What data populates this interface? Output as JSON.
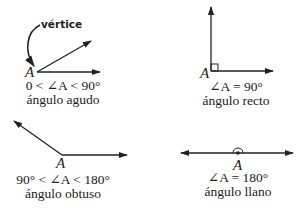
{
  "annotation": {
    "vertex_label": "vértice"
  },
  "angles": [
    {
      "id": "acute",
      "vertex": "A",
      "relation": "0 < ∠A < 90°",
      "name": "ángulo agudo"
    },
    {
      "id": "right",
      "vertex": "A",
      "relation": "∠A = 90°",
      "name": "ángulo recto"
    },
    {
      "id": "obtuse",
      "vertex": "A",
      "relation": "90° < ∠A < 180°",
      "name": "ángulo obtuso"
    },
    {
      "id": "straight",
      "vertex": "A",
      "relation": "∠A = 180°",
      "name": "ángulo llano"
    }
  ],
  "colors": {
    "stroke": "#222222",
    "background": "#ffffff"
  }
}
